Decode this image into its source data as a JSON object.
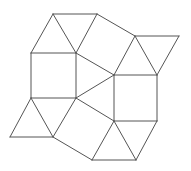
{
  "diagram": {
    "stroke_color": "#555555",
    "stroke_width": 1,
    "background": "#ffffff",
    "vertices": {
      "A": [
        53,
        14
      ],
      "B": [
        97,
        14
      ],
      "C": [
        31,
        53
      ],
      "D": [
        76,
        53
      ],
      "E": [
        31,
        98
      ],
      "F": [
        76,
        98
      ],
      "G": [
        135,
        36
      ],
      "H": [
        179,
        36
      ],
      "J": [
        114,
        75
      ],
      "I": [
        157,
        75
      ],
      "K": [
        114,
        121
      ],
      "L": [
        157,
        121
      ],
      "M": [
        10,
        137
      ],
      "N": [
        53,
        137
      ],
      "O": [
        92,
        160
      ],
      "P": [
        136,
        160
      ]
    },
    "edges": [
      [
        "A",
        "B"
      ],
      [
        "A",
        "C"
      ],
      [
        "A",
        "D"
      ],
      [
        "B",
        "D"
      ],
      [
        "C",
        "D"
      ],
      [
        "C",
        "E"
      ],
      [
        "D",
        "F"
      ],
      [
        "E",
        "F"
      ],
      [
        "B",
        "G"
      ],
      [
        "D",
        "J"
      ],
      [
        "G",
        "J"
      ],
      [
        "G",
        "H"
      ],
      [
        "G",
        "I"
      ],
      [
        "H",
        "I"
      ],
      [
        "J",
        "I"
      ],
      [
        "J",
        "K"
      ],
      [
        "I",
        "L"
      ],
      [
        "K",
        "L"
      ],
      [
        "F",
        "J"
      ],
      [
        "F",
        "K"
      ],
      [
        "E",
        "M"
      ],
      [
        "M",
        "N"
      ],
      [
        "E",
        "N"
      ],
      [
        "F",
        "N"
      ],
      [
        "N",
        "O"
      ],
      [
        "K",
        "O"
      ],
      [
        "O",
        "P"
      ],
      [
        "K",
        "P"
      ],
      [
        "L",
        "P"
      ]
    ],
    "shapes": {
      "squares": [
        [
          "C",
          "D",
          "F",
          "E"
        ],
        [
          "B",
          "G",
          "J",
          "D"
        ],
        [
          "J",
          "I",
          "L",
          "K"
        ],
        [
          "F",
          "K",
          "O",
          "N"
        ]
      ],
      "triangles": [
        [
          "A",
          "B",
          "D"
        ],
        [
          "A",
          "C",
          "D"
        ],
        [
          "D",
          "J",
          "F"
        ],
        [
          "G",
          "H",
          "I"
        ],
        [
          "G",
          "I",
          "J"
        ],
        [
          "E",
          "M",
          "N"
        ],
        [
          "E",
          "F",
          "N"
        ],
        [
          "K",
          "O",
          "P"
        ],
        [
          "K",
          "L",
          "P"
        ]
      ]
    }
  }
}
